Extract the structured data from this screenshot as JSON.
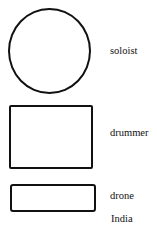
{
  "diagram": {
    "shapes": [
      {
        "type": "circle",
        "label": "soloist"
      },
      {
        "type": "rectangle",
        "label": "drummer"
      },
      {
        "type": "rectangle",
        "label": "drone"
      }
    ],
    "caption": "India"
  }
}
